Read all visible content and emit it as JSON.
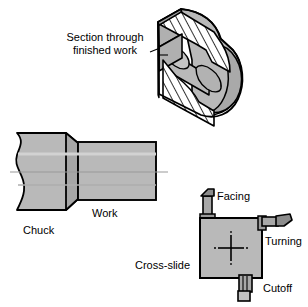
{
  "figure": {
    "title_alt": "Lathe operations: sectioned finished work, chuck with work, and cross-slide with tooling",
    "colors": {
      "background": "#ffffff",
      "metal_fill": "#b9b9b9",
      "metal_fill_dark": "#a3a3a3",
      "metal_fill_light": "#c9c9c9",
      "hatch_fill": "#ffffff",
      "outline": "#000000",
      "centerline": "#9a9a9a",
      "text": "#000000"
    },
    "font_size_px": 11
  },
  "labels": {
    "section_line1": "Section through",
    "section_line2": "finished work",
    "chuck": "Chuck",
    "work": "Work",
    "facing": "Facing",
    "turning": "Turning",
    "cross_slide": "Cross-slide",
    "cutoff": "Cutoff"
  },
  "parts": {
    "section_view": {
      "name": "sectioned-finished-work",
      "description": "Isometric half-section of a cylindrical finished workpiece with a through bore, section hatching shown"
    },
    "chuck_view": {
      "name": "chuck-and-work",
      "chuck_description": "Chuck body shown with a wavy break line on the left and a chamfered right face",
      "work_description": "Cylindrical workpiece projecting to the right from the chuck jaws, centerline through axis"
    },
    "cross_slide_view": {
      "name": "cross-slide-with-tools",
      "slide_description": "Square cross-slide plate with crosshair center mark",
      "tools": [
        {
          "id": "facing-tool",
          "label": "Facing",
          "position": "top"
        },
        {
          "id": "turning-tool",
          "label": "Turning",
          "position": "right"
        },
        {
          "id": "cutoff-tool",
          "label": "Cutoff",
          "position": "bottom"
        }
      ]
    }
  }
}
